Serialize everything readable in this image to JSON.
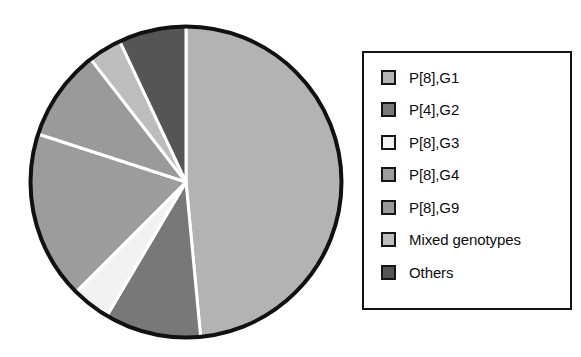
{
  "chart_data": {
    "type": "pie",
    "title": "",
    "legend_position": "right",
    "start_angle_deg": 0,
    "direction": "clockwise",
    "categories": [
      "P[8],G1",
      "P[4],G2",
      "P[8],G3",
      "P[8],G4",
      "P[8],G9",
      "Mixed genotypes",
      "Others"
    ],
    "values": [
      48.5,
      10.0,
      4.0,
      17.5,
      9.5,
      3.5,
      7.0
    ],
    "colors": [
      "#b3b3b3",
      "#787878",
      "#f2f2f2",
      "#9c9c9c",
      "#9a9a9a",
      "#bdbdbd",
      "#555555"
    ],
    "slices": [
      {
        "label": "P[8],G1",
        "value": 48.5,
        "color": "#b3b3b3",
        "start_deg": 0.0,
        "end_deg": 174.6
      },
      {
        "label": "P[4],G2",
        "value": 10.0,
        "color": "#787878",
        "start_deg": 174.6,
        "end_deg": 210.6
      },
      {
        "label": "P[8],G3",
        "value": 4.0,
        "color": "#f2f2f2",
        "start_deg": 210.6,
        "end_deg": 225.0
      },
      {
        "label": "P[8],G4",
        "value": 17.5,
        "color": "#9c9c9c",
        "start_deg": 225.0,
        "end_deg": 288.0
      },
      {
        "label": "P[8],G9",
        "value": 9.5,
        "color": "#9a9a9a",
        "start_deg": 288.0,
        "end_deg": 322.2
      },
      {
        "label": "Mixed genotypes",
        "value": 3.5,
        "color": "#bdbdbd",
        "start_deg": 322.2,
        "end_deg": 334.8
      },
      {
        "label": "Others",
        "value": 7.0,
        "color": "#555555",
        "start_deg": 334.8,
        "end_deg": 360.0
      }
    ],
    "xlabel": "",
    "ylabel": "",
    "grid": false
  },
  "legend": {
    "items": [
      {
        "label": "P[8],G1",
        "color": "#b3b3b3"
      },
      {
        "label": "P[4],G2",
        "color": "#787878"
      },
      {
        "label": "P[8],G3",
        "color": "#f2f2f2"
      },
      {
        "label": "P[8],G4",
        "color": "#9c9c9c"
      },
      {
        "label": "P[8],G9",
        "color": "#9a9a9a"
      },
      {
        "label": "Mixed genotypes",
        "color": "#bdbdbd"
      },
      {
        "label": "Others",
        "color": "#555555"
      }
    ]
  },
  "style": {
    "pie_outline": "#111111",
    "slice_separator": "#ffffff",
    "legend_border": "#111111",
    "background": "#ffffff"
  }
}
